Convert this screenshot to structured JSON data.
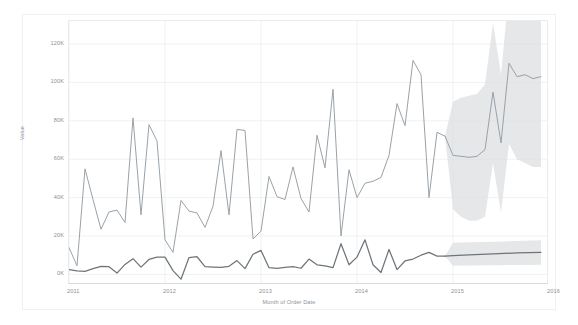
{
  "chart_data": {
    "type": "line",
    "title": "",
    "subtitle": "",
    "xlabel": "Month of Order Date",
    "ylabel": "Value",
    "grid": true,
    "legend_position": "none",
    "xtick_labels": [
      "2011",
      "2012",
      "2013",
      "2014",
      "2015",
      "2016"
    ],
    "ytick_labels": [
      "0K",
      "20K",
      "40K",
      "60K",
      "80K",
      "100K",
      "120K"
    ],
    "ytick_values": [
      0,
      20000,
      40000,
      60000,
      80000,
      100000,
      120000
    ],
    "ylim": [
      -5000,
      132000
    ],
    "xlim": [
      "2011-01",
      "2016-01"
    ],
    "forecast_start": "2014-12",
    "annotations": [
      "Forecast region shown with shaded confidence bands"
    ],
    "colors": {
      "series_sales_line": "#9aa2a8",
      "series_profit_line": "#6e757a",
      "confidence_band": "#dcdfe1",
      "gridline": "#f0f1f2",
      "axis_text": "#8c9196",
      "panel_border": "#e9ebec",
      "background": "#ffffff"
    },
    "series": [
      {
        "name": "Sales",
        "color": "#9aa2a8",
        "kind": "actual",
        "x": [
          "2011-01",
          "2011-02",
          "2011-03",
          "2011-04",
          "2011-05",
          "2011-06",
          "2011-07",
          "2011-08",
          "2011-09",
          "2011-10",
          "2011-11",
          "2011-12",
          "2012-01",
          "2012-02",
          "2012-03",
          "2012-04",
          "2012-05",
          "2012-06",
          "2012-07",
          "2012-08",
          "2012-09",
          "2012-10",
          "2012-11",
          "2012-12",
          "2013-01",
          "2013-02",
          "2013-03",
          "2013-04",
          "2013-05",
          "2013-06",
          "2013-07",
          "2013-08",
          "2013-09",
          "2013-10",
          "2013-11",
          "2013-12",
          "2014-01",
          "2014-02",
          "2014-03",
          "2014-04",
          "2014-05",
          "2014-06",
          "2014-07",
          "2014-08",
          "2014-09",
          "2014-10",
          "2014-11",
          "2014-12"
        ],
        "values": [
          14000,
          4500,
          55000,
          39000,
          23500,
          32500,
          33500,
          27000,
          81500,
          31000,
          78000,
          69500,
          18000,
          11500,
          38500,
          33000,
          32000,
          24500,
          35500,
          64500,
          31000,
          75500,
          75000,
          18500,
          22500,
          51000,
          40500,
          39000,
          56000,
          39500,
          32500,
          72500,
          55500,
          96500,
          20000,
          54500,
          40000,
          47500,
          48500,
          50500,
          62000,
          89000,
          77500,
          111500,
          104000,
          40000,
          74000,
          72000
        ]
      },
      {
        "name": "Sales (forecast)",
        "color": "#9aa2a8",
        "kind": "forecast",
        "x": [
          "2014-12",
          "2015-01",
          "2015-02",
          "2015-03",
          "2015-04",
          "2015-05",
          "2015-06",
          "2015-07",
          "2015-08",
          "2015-09",
          "2015-10",
          "2015-11",
          "2015-12"
        ],
        "values": [
          72000,
          62000,
          61500,
          61000,
          61500,
          65000,
          95000,
          68500,
          110000,
          103000,
          104000,
          102000,
          103000
        ],
        "lower": [
          72000,
          34000,
          30000,
          28000,
          28000,
          30000,
          58000,
          32000,
          68000,
          60000,
          58000,
          56000,
          56000
        ],
        "upper": [
          72000,
          90000,
          92000,
          93000,
          94000,
          99000,
          131000,
          104000,
          148000,
          142000,
          145000,
          144000,
          146000
        ]
      },
      {
        "name": "Profit",
        "color": "#6e757a",
        "kind": "actual",
        "x": [
          "2011-01",
          "2011-02",
          "2011-03",
          "2011-04",
          "2011-05",
          "2011-06",
          "2011-07",
          "2011-08",
          "2011-09",
          "2011-10",
          "2011-11",
          "2011-12",
          "2012-01",
          "2012-02",
          "2012-03",
          "2012-04",
          "2012-05",
          "2012-06",
          "2012-07",
          "2012-08",
          "2012-09",
          "2012-10",
          "2012-11",
          "2012-12",
          "2013-01",
          "2013-02",
          "2013-03",
          "2013-04",
          "2013-05",
          "2013-06",
          "2013-07",
          "2013-08",
          "2013-09",
          "2013-10",
          "2013-11",
          "2013-12",
          "2014-01",
          "2014-02",
          "2014-03",
          "2014-04",
          "2014-05",
          "2014-06",
          "2014-07",
          "2014-08",
          "2014-09",
          "2014-10",
          "2014-11",
          "2014-12"
        ],
        "values": [
          2500,
          1800,
          1600,
          3000,
          4200,
          4000,
          700,
          5200,
          8200,
          3800,
          7800,
          9000,
          9000,
          2000,
          -2500,
          8800,
          9200,
          4000,
          3800,
          3600,
          4200,
          7200,
          3000,
          10500,
          12500,
          3500,
          3200,
          3600,
          4000,
          3200,
          8000,
          5000,
          4400,
          3500,
          16000,
          5000,
          9000,
          18000,
          5000,
          1000,
          13000,
          2500,
          7000,
          8000,
          10000,
          11500,
          9500,
          9500
        ]
      },
      {
        "name": "Profit (forecast)",
        "color": "#6e757a",
        "kind": "forecast",
        "x": [
          "2014-12",
          "2015-01",
          "2015-03",
          "2015-06",
          "2015-09",
          "2015-12"
        ],
        "values": [
          9500,
          9800,
          10200,
          10700,
          11200,
          11500
        ],
        "lower": [
          9500,
          4500,
          4600,
          4800,
          4900,
          5000
        ],
        "upper": [
          9500,
          16500,
          16800,
          17000,
          17400,
          17800
        ]
      }
    ]
  }
}
